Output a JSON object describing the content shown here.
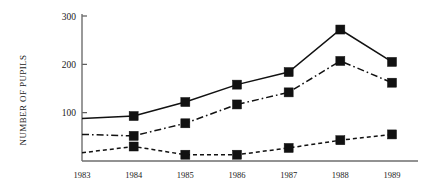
{
  "chart_data": {
    "type": "line",
    "title": "",
    "xlabel": "",
    "ylabel": "NUMBER OF PUPILS",
    "categories": [
      "1983",
      "1984",
      "1985",
      "1986",
      "1987",
      "1988",
      "1989"
    ],
    "x": [
      1983,
      1984,
      1985,
      1986,
      1987,
      1988,
      1989
    ],
    "ylim": [
      0,
      300
    ],
    "xlim": [
      1983,
      1989
    ],
    "yticks": [
      100,
      200,
      300
    ],
    "ytick_labels": [
      "100",
      "200",
      "300"
    ],
    "xtick_labels": [
      "1983",
      "1984",
      "1985",
      "1986",
      "1987",
      "1988",
      "1989"
    ],
    "grid": false,
    "legend": "none",
    "marker": "filled-square",
    "series": [
      {
        "name": "series-solid",
        "linestyle": "solid",
        "color": "#111111",
        "values": [
          88,
          93,
          122,
          158,
          184,
          272,
          205
        ],
        "markers_from_index": 1
      },
      {
        "name": "series-dash-dot",
        "linestyle": "dash-dot",
        "color": "#111111",
        "values": [
          55,
          52,
          78,
          117,
          142,
          207,
          162
        ],
        "markers_from_index": 1
      },
      {
        "name": "series-dotted",
        "linestyle": "dotted",
        "color": "#111111",
        "values": [
          17,
          30,
          13,
          13,
          27,
          43,
          55
        ],
        "markers_from_index": 1
      }
    ]
  },
  "axes": {
    "y_axis_title": "NUMBER OF PUPILS"
  }
}
